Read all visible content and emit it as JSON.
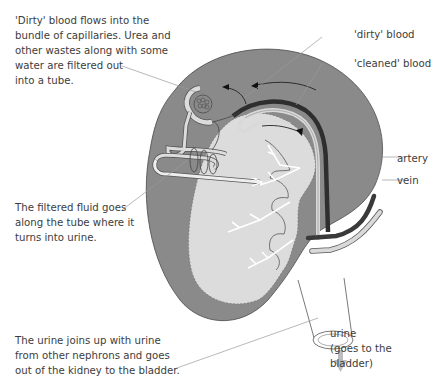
{
  "diagram": {
    "annotations": {
      "dirty_blood_inflow": "'Dirty'  blood flows into the\nbundle of capillaries. Urea and\nother wastes along with some\nwater are filtered out\ninto a tube.",
      "filtered_fluid": "The filtered fluid goes\nalong the tube where it\nturns into urine.",
      "urine_joins": "The urine joins up with urine\nfrom other nephrons and goes\nout of the kidney to the bladder."
    },
    "labels": {
      "dirty_blood": "'dirty' blood",
      "cleaned_blood": "'cleaned' blood",
      "artery": "artery",
      "vein": "vein",
      "urine": "urine",
      "urine_destination": "(goes to the bladder)"
    },
    "colors": {
      "cortex": "#8a8a8a",
      "medulla": "#dcdcdc",
      "artery": "#3a3a3a",
      "vein": "#d9d9d9",
      "leader_line": "#9a9a9a",
      "urine_arrow": "#bdbdbd"
    }
  }
}
